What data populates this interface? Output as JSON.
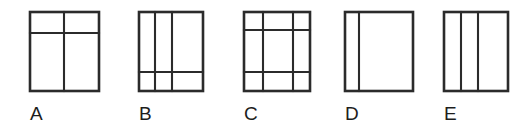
{
  "sheet": {
    "width": 531,
    "height": 126,
    "background_color": "#ffffff",
    "line_color": "#2b2b2b",
    "label_color": "#1d1d1d",
    "description": "Five labeled rectangles subdivided by straight lines"
  },
  "figures": [
    {
      "label": "A",
      "label_x": 30,
      "label_y": 104,
      "box": {
        "x": 30,
        "y": 12,
        "width": 69,
        "height": 79
      },
      "vertical_lines": [
        64
      ],
      "horizontal_lines": [
        33
      ],
      "cell_count": 4
    },
    {
      "label": "B",
      "label_x": 139,
      "label_y": 104,
      "box": {
        "x": 139,
        "y": 12,
        "width": 64,
        "height": 79
      },
      "vertical_lines": [
        155,
        172
      ],
      "horizontal_lines": [
        72
      ],
      "cell_count": 6
    },
    {
      "label": "C",
      "label_x": 244,
      "label_y": 104,
      "box": {
        "x": 244,
        "y": 12,
        "width": 66,
        "height": 79
      },
      "vertical_lines": [
        263,
        293
      ],
      "horizontal_lines": [
        30,
        72
      ],
      "cell_count": 9
    },
    {
      "label": "D",
      "label_x": 345,
      "label_y": 104,
      "box": {
        "x": 345,
        "y": 12,
        "width": 68,
        "height": 79
      },
      "vertical_lines": [
        359
      ],
      "horizontal_lines": [],
      "cell_count": 2
    },
    {
      "label": "E",
      "label_x": 444,
      "label_y": 104,
      "box": {
        "x": 444,
        "y": 12,
        "width": 64,
        "height": 79
      },
      "vertical_lines": [
        461,
        478
      ],
      "horizontal_lines": [],
      "cell_count": 3
    }
  ]
}
